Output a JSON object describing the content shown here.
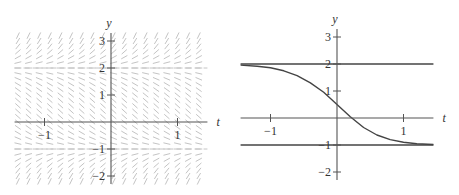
{
  "chart_data": [
    {
      "type": "slope-field",
      "title": "",
      "xlabel": "t",
      "ylabel": "y",
      "equation_form": "dy/dt = (y - 2)(y + 1)",
      "xlim": [
        -1.45,
        1.45
      ],
      "ylim": [
        -2.3,
        3.3
      ],
      "xticks": [
        -1,
        1
      ],
      "xtick_labels": [
        "−1",
        "1"
      ],
      "yticks": [
        -2,
        -1,
        1,
        2,
        3
      ],
      "ytick_labels": [
        "−2",
        "−1",
        "1",
        "2",
        "3"
      ],
      "equilibria": [
        2,
        -1
      ],
      "grid_step": {
        "t": 0.1,
        "y": 0.2
      },
      "colors": {
        "axis": "#555555",
        "segments": "#c4c4c4",
        "text": "#333333"
      }
    },
    {
      "type": "line",
      "title": "",
      "xlabel": "t",
      "ylabel": "y",
      "xlim": [
        -1.45,
        1.45
      ],
      "ylim": [
        -2.3,
        3.3
      ],
      "xticks": [
        -1,
        1
      ],
      "xtick_labels": [
        "−1",
        "1"
      ],
      "yticks": [
        -2,
        -1,
        1,
        2,
        3
      ],
      "ytick_labels": [
        "−2",
        "−1",
        "1",
        "2",
        "3"
      ],
      "series": [
        {
          "name": "equilibrium y=2",
          "kind": "horizontal",
          "y": 2
        },
        {
          "name": "equilibrium y=-1",
          "kind": "horizontal",
          "y": -1
        },
        {
          "name": "solution y(0)=0.5",
          "kind": "curve",
          "x": [
            -1.45,
            -1.2,
            -1.0,
            -0.8,
            -0.6,
            -0.4,
            -0.2,
            0.0,
            0.2,
            0.4,
            0.6,
            0.8,
            1.0,
            1.2,
            1.45
          ],
          "values": [
            1.96,
            1.92,
            1.86,
            1.75,
            1.57,
            1.3,
            0.95,
            0.5,
            0.05,
            -0.35,
            -0.63,
            -0.8,
            -0.9,
            -0.95,
            -0.98
          ]
        }
      ],
      "colors": {
        "axis": "#555555",
        "curve": "#444444",
        "text": "#333333"
      }
    }
  ],
  "plots": {
    "left": {
      "t_label": "t",
      "y_label": "y"
    },
    "right": {
      "t_label": "t",
      "y_label": "y"
    }
  }
}
